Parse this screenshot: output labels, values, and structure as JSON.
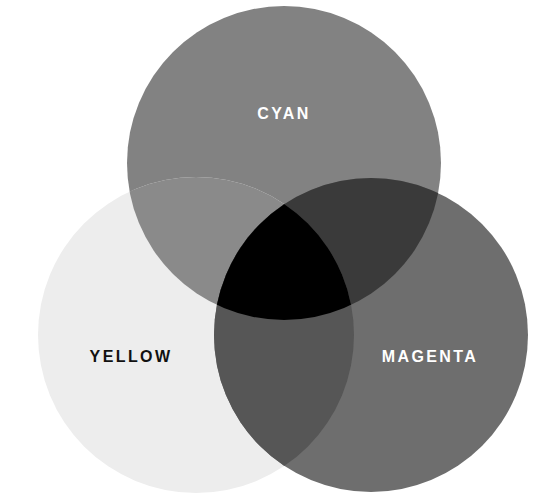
{
  "diagram": {
    "background_color": "#ffffff",
    "width": 545,
    "height": 503
  },
  "chart_data": {
    "type": "venn",
    "set_count": 3,
    "background": "#ffffff",
    "sets": [
      {
        "id": "cyan",
        "label": "CYAN",
        "fill": "#828282",
        "label_color": "#ffffff",
        "cx": 284,
        "cy": 163,
        "r": 157,
        "label_x": 284,
        "label_y": 114
      },
      {
        "id": "yellow",
        "label": "YELLOW",
        "fill": "#ededed",
        "label_color": "#111111",
        "cx": 196,
        "cy": 335,
        "r": 158,
        "label_x": 131,
        "label_y": 357
      },
      {
        "id": "magenta",
        "label": "MAGENTA",
        "fill": "#6e6e6e",
        "label_color": "#ffffff",
        "cx": 371,
        "cy": 335,
        "r": 157,
        "label_x": 430,
        "label_y": 357
      }
    ],
    "intersections": [
      {
        "id": "cyan-yellow",
        "sets": [
          "cyan",
          "yellow"
        ],
        "fill": "#8a8a8a"
      },
      {
        "id": "cyan-magenta",
        "sets": [
          "cyan",
          "magenta"
        ],
        "fill": "#3a3a3a"
      },
      {
        "id": "yellow-magenta",
        "sets": [
          "yellow",
          "magenta"
        ],
        "fill": "#565656"
      },
      {
        "id": "cyan-yellow-magenta",
        "sets": [
          "cyan",
          "yellow",
          "magenta"
        ],
        "fill": "#000000"
      }
    ]
  }
}
